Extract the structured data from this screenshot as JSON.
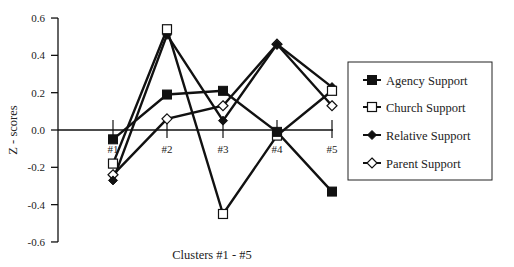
{
  "chart_data": {
    "type": "line",
    "title": "",
    "xlabel": "Clusters #1 - #5",
    "ylabel": "Z - scores",
    "categories": [
      "#1",
      "#2",
      "#3",
      "#4",
      "#5"
    ],
    "ylim": [
      -0.6,
      0.6
    ],
    "yticks": [
      "0.6",
      "0.4",
      "0.2",
      "0.0",
      "-0.2",
      "-0.4",
      "-0.6"
    ],
    "grid": false,
    "legend_position": "right",
    "series": [
      {
        "name": "Agency Support",
        "marker": "filled-square",
        "values": [
          -0.05,
          0.19,
          0.21,
          -0.01,
          -0.33
        ]
      },
      {
        "name": "Church Support",
        "marker": "open-square",
        "values": [
          -0.18,
          0.54,
          -0.45,
          -0.03,
          0.21
        ]
      },
      {
        "name": "Relative Support",
        "marker": "filled-diamond",
        "values": [
          -0.27,
          0.51,
          0.05,
          0.46,
          0.23
        ]
      },
      {
        "name": "Parent Support",
        "marker": "open-diamond",
        "values": [
          -0.24,
          0.06,
          0.13,
          0.46,
          0.13
        ]
      }
    ]
  },
  "colors": {
    "line": "#111111",
    "background": "#ffffff"
  }
}
